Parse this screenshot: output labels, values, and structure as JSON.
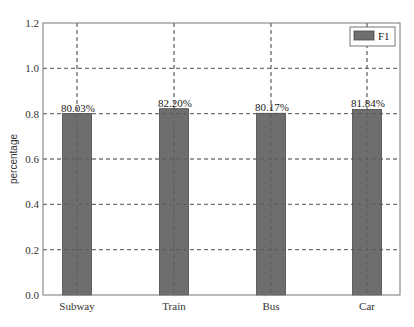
{
  "chart_data": {
    "type": "bar",
    "title": "",
    "xlabel": "",
    "ylabel": "percentage",
    "categories": [
      "Subway",
      "Train",
      "Bus",
      "Car"
    ],
    "series": [
      {
        "name": "F1",
        "values": [
          0.8003,
          0.822,
          0.8017,
          0.8184
        ],
        "color": "#6e6e6e"
      }
    ],
    "value_labels": [
      "80.03%",
      "82.20%",
      "80.17%",
      "81.84%"
    ],
    "ylim": [
      0.0,
      1.2
    ],
    "yticks": [
      0.0,
      0.2,
      0.4,
      0.6,
      0.8,
      1.0,
      1.2
    ],
    "ytick_labels": [
      "0.0",
      "0.2",
      "0.4",
      "0.6",
      "0.8",
      "1.0",
      "1.2"
    ],
    "grid": true,
    "grid_style": "dashed",
    "legend_position": "upper right"
  },
  "legend": {
    "label": "F1"
  },
  "axis": {
    "ylabel": "percentage"
  },
  "colors": {
    "bar": "#6e6e6e",
    "bar_edge": "#4a4a4a",
    "grid": "#555555",
    "axis": "#666666"
  }
}
